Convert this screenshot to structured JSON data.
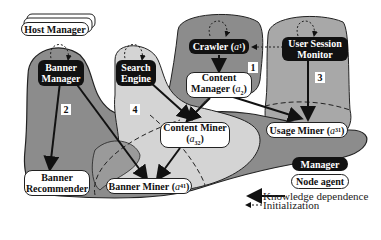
{
  "diagram": {
    "host_manager": "Host Manager",
    "managers": {
      "banner_manager": [
        "Banner",
        "Manager"
      ],
      "search_engine": [
        "Search",
        "Engine"
      ],
      "crawler": "Crawler",
      "crawler_sub": "1",
      "user_session_monitor": [
        "User Session",
        "Monitor"
      ]
    },
    "agents": {
      "content_manager": [
        "Content",
        "Manager"
      ],
      "content_manager_sub": "2",
      "content_miner": "Content Miner",
      "content_miner_sub": "32",
      "usage_miner": "Usage Miner",
      "usage_miner_sub": "31",
      "banner_miner": "Banner Miner",
      "banner_miner_sub": "41",
      "banner_recommender": [
        "Banner",
        "Recommender"
      ]
    },
    "region_numbers": [
      "1",
      "2",
      "3",
      "4"
    ],
    "legend": {
      "manager": "Manager",
      "node_agent": "Node agent",
      "knowledge": "Knowledge dependence",
      "init": "Initialization"
    },
    "colors": {
      "region_dark": "#8c8c8c",
      "region_light": "#d4d4d4",
      "manager_fill": "#111111",
      "agent_fill": "#ffffff"
    }
  }
}
